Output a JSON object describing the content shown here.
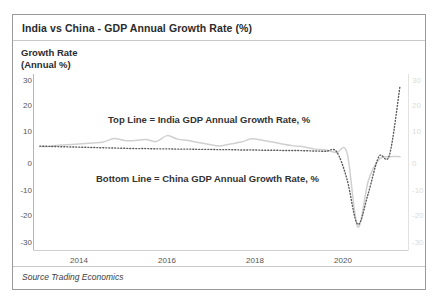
{
  "chart": {
    "title": "India vs China - GDP Annual Growth Rate (%)",
    "y_axis_label_line1": "Growth Rate",
    "y_axis_label_line2": "(Annual %)",
    "source": "Source  Trading Economics",
    "annotation_india": "Top Line  =  India GDP Annual Growth Rate, %",
    "annotation_china": "Bottom Line  =  China GDP Annual Growth Rate, %"
  },
  "colors": {
    "india_line": "#d0d0d0",
    "china_line": "#5a5a5a",
    "frame": "#9a9a9a",
    "axis": "#b5b5b5",
    "text": "#2b2b2b",
    "tick_text": "#555555",
    "right_tick_text": "#dcdcdc",
    "background": "#ffffff"
  },
  "chart_data": {
    "type": "line",
    "title": "India vs China - GDP Annual Growth Rate (%)",
    "xlabel": "",
    "ylabel": "Growth Rate (Annual %)",
    "ylim": [
      -30,
      30
    ],
    "xlim": [
      2012.75,
      2021.6
    ],
    "grid": false,
    "legend": "annotations-inline",
    "y_ticks": [
      30,
      20,
      10,
      0,
      -10,
      -20,
      -30
    ],
    "y_tick_labels": [
      "30",
      "20",
      "10",
      "0",
      "-10",
      "-20",
      "-30"
    ],
    "y_ticks_right": [
      30,
      20,
      10,
      0,
      -10,
      -20,
      -30
    ],
    "y_tick_labels_right": [
      "30",
      "20",
      "10",
      "0",
      "-10",
      "-20",
      "-30"
    ],
    "x_ticks": [
      2014,
      2016,
      2018,
      2020
    ],
    "x_tick_labels": [
      "2014",
      "2016",
      "2018",
      "2020"
    ],
    "series": [
      {
        "name": "India GDP Annual Growth Rate, %",
        "style": "solid",
        "color": "#d0d0d0",
        "label_position": "top",
        "x": [
          2012.9,
          2013.15,
          2013.4,
          2013.65,
          2013.9,
          2014.15,
          2014.4,
          2014.65,
          2014.9,
          2015.15,
          2015.4,
          2015.65,
          2015.9,
          2016.15,
          2016.4,
          2016.65,
          2016.9,
          2017.15,
          2017.4,
          2017.65,
          2017.9,
          2018.15,
          2018.4,
          2018.65,
          2018.9,
          2019.15,
          2019.4,
          2019.65,
          2019.9,
          2020.15,
          2020.4,
          2020.65,
          2020.9,
          2021.15,
          2021.4
        ],
        "values": [
          5.4,
          5.5,
          5.9,
          6.1,
          6.4,
          6.7,
          7.0,
          8.3,
          7.6,
          7.6,
          8.0,
          7.2,
          9.4,
          8.1,
          7.6,
          6.8,
          6.1,
          5.6,
          6.3,
          7.0,
          8.2,
          7.7,
          7.0,
          6.2,
          5.6,
          5.2,
          4.4,
          4.1,
          3.1,
          3.0,
          -24.4,
          -7.4,
          0.5,
          1.6,
          1.6
        ]
      },
      {
        "name": "China GDP Annual Growth Rate, %",
        "style": "dotted",
        "color": "#5a5a5a",
        "label_position": "bottom",
        "x": [
          2012.9,
          2013.15,
          2013.4,
          2013.65,
          2013.9,
          2014.15,
          2014.4,
          2014.65,
          2014.9,
          2015.15,
          2015.4,
          2015.65,
          2015.9,
          2016.15,
          2016.4,
          2016.65,
          2016.9,
          2017.15,
          2017.4,
          2017.65,
          2017.9,
          2018.15,
          2018.4,
          2018.65,
          2018.9,
          2019.15,
          2019.4,
          2019.65,
          2019.9,
          2020.15,
          2020.4,
          2020.65,
          2020.9,
          2021.15,
          2021.4
        ],
        "values": [
          5.5,
          5.4,
          5.3,
          5.2,
          5.1,
          5.0,
          4.9,
          4.8,
          4.7,
          4.6,
          4.6,
          4.5,
          4.5,
          4.4,
          4.4,
          4.3,
          4.3,
          4.2,
          4.2,
          4.1,
          4.1,
          4.0,
          4.0,
          3.9,
          3.9,
          3.8,
          3.7,
          3.6,
          3.5,
          -6.8,
          -23.4,
          -12.0,
          1.6,
          2.2,
          27.8
        ]
      }
    ],
    "annotations": [
      {
        "text": "Top Line  =  India GDP Annual Growth Rate, %",
        "x": 2015.2,
        "y": 13
      },
      {
        "text": "Bottom Line  =  China GDP Annual Growth Rate, %",
        "x": 2015.0,
        "y": -3
      }
    ]
  }
}
